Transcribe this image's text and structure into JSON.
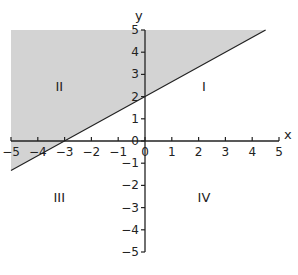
{
  "figure": {
    "axes": {
      "x_label": "x",
      "y_label": "y",
      "x_range": [
        -5,
        5
      ],
      "y_range": [
        -5,
        5
      ],
      "x_ticks": [
        "-5",
        "-4",
        "-3",
        "-2",
        "-1",
        "0",
        "1",
        "2",
        "3",
        "4",
        "5"
      ],
      "y_ticks": [
        "-5",
        "-4",
        "-3",
        "-2",
        "-1",
        "0",
        "1",
        "2",
        "3",
        "4",
        "5"
      ]
    },
    "quadrants": [
      {
        "id": "I",
        "label": "I",
        "x": 2.2,
        "y": 2.5
      },
      {
        "id": "II",
        "label": "II",
        "x": -3.2,
        "y": 2.5
      },
      {
        "id": "III",
        "label": "III",
        "x": -3.2,
        "y": -2.5
      },
      {
        "id": "IV",
        "label": "IV",
        "x": 2.2,
        "y": -2.5
      }
    ],
    "boundary_line": {
      "equation": "y = (2/3)x + 2",
      "slope": 0.6667,
      "intercept": 2,
      "x_intercept": -3,
      "y_intercept": 2,
      "start": [
        -5,
        -1.333
      ],
      "end": [
        4.5,
        5
      ],
      "style": "solid"
    },
    "shaded_region": {
      "description": "y >= (2/3)x + 2 within the plotted window",
      "color": "#d3d3d3"
    },
    "colors": {
      "shade": "#d3d3d3",
      "line": "#222222",
      "axis": "#222222"
    }
  }
}
